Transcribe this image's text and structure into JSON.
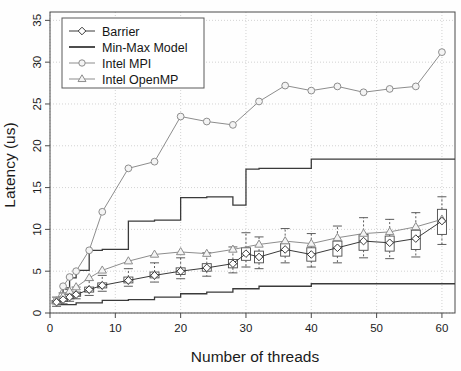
{
  "chart_data": {
    "type": "line",
    "title": "",
    "xlabel": "Number of threads",
    "ylabel": "Latency (us)",
    "xlim": [
      0,
      62
    ],
    "ylim": [
      0,
      36
    ],
    "xticks": [
      0,
      10,
      20,
      30,
      40,
      50,
      60
    ],
    "yticks": [
      0,
      5,
      10,
      15,
      20,
      25,
      30,
      35
    ],
    "grid": true,
    "grid_style": "dotted",
    "legend_position": "top-left",
    "legend": [
      "Barrier",
      "Min-Max Model",
      "Intel MPI",
      "Intel OpenMP"
    ],
    "series": [
      {
        "name": "Barrier",
        "marker": "diamond",
        "color": "#3a3a3a",
        "render": "boxplot+line",
        "x": [
          1,
          2,
          3,
          4,
          6,
          8,
          12,
          16,
          20,
          24,
          28,
          30,
          32,
          36,
          40,
          44,
          48,
          52,
          56,
          60
        ],
        "values": [
          1.3,
          1.6,
          1.9,
          2.2,
          2.8,
          3.3,
          3.9,
          4.5,
          5.0,
          5.4,
          5.9,
          7.1,
          6.7,
          7.6,
          7.0,
          7.8,
          8.6,
          8.4,
          8.9,
          11.0
        ],
        "box_q1": [
          1.1,
          1.4,
          1.7,
          2.0,
          2.5,
          3.0,
          3.6,
          4.2,
          4.6,
          5.0,
          5.4,
          6.3,
          6.0,
          6.8,
          6.2,
          6.8,
          7.5,
          7.4,
          7.6,
          9.4
        ],
        "box_q3": [
          1.5,
          1.9,
          2.2,
          2.5,
          3.1,
          3.6,
          4.3,
          4.9,
          5.4,
          5.9,
          6.4,
          7.8,
          7.4,
          8.3,
          7.8,
          8.6,
          9.4,
          9.2,
          9.9,
          12.4
        ],
        "whisker_low": [
          0.8,
          1.1,
          1.4,
          1.7,
          2.1,
          2.6,
          3.2,
          3.7,
          4.1,
          4.4,
          4.8,
          5.5,
          5.3,
          6.0,
          5.5,
          6.0,
          6.6,
          6.5,
          6.7,
          8.2
        ],
        "whisker_high": [
          1.9,
          2.4,
          2.8,
          3.1,
          3.9,
          4.5,
          5.3,
          6.0,
          6.6,
          7.2,
          7.9,
          9.6,
          9.1,
          10.1,
          9.5,
          10.4,
          11.4,
          11.2,
          12.0,
          13.9
        ]
      },
      {
        "name": "Intel MPI",
        "marker": "circle",
        "color": "#8d8d8d",
        "render": "line",
        "x": [
          1,
          2,
          3,
          4,
          6,
          8,
          12,
          16,
          20,
          24,
          28,
          32,
          36,
          40,
          44,
          48,
          52,
          56,
          60
        ],
        "values": [
          1.5,
          3.2,
          4.3,
          5.0,
          7.5,
          12.1,
          17.3,
          18.1,
          23.5,
          22.9,
          22.5,
          25.3,
          27.2,
          26.6,
          27.1,
          26.4,
          26.8,
          27.1,
          31.2
        ]
      },
      {
        "name": "Intel OpenMP",
        "marker": "triangle",
        "color": "#8d8d8d",
        "render": "line",
        "x": [
          1,
          2,
          3,
          4,
          6,
          8,
          12,
          16,
          20,
          24,
          28,
          32,
          36,
          40,
          44,
          48,
          52,
          56,
          60
        ],
        "values": [
          1.4,
          2.0,
          2.6,
          3.1,
          4.2,
          5.1,
          6.2,
          7.0,
          7.3,
          7.1,
          7.6,
          8.2,
          8.6,
          8.3,
          9.0,
          9.5,
          9.7,
          10.3,
          11.2
        ]
      },
      {
        "name": "Min-Max Model (upper)",
        "marker": "none",
        "color": "#3a3a3a",
        "render": "step",
        "x": [
          1,
          2,
          3,
          4,
          6,
          8,
          12,
          16,
          20,
          24,
          28,
          30,
          32,
          40,
          62
        ],
        "values": [
          1.4,
          3.0,
          4.2,
          5.1,
          7.5,
          7.6,
          11.0,
          11.1,
          13.8,
          13.9,
          12.9,
          17.2,
          17.3,
          18.4,
          18.4
        ]
      },
      {
        "name": "Min-Max Model (lower)",
        "marker": "none",
        "color": "#3a3a3a",
        "render": "step",
        "x": [
          1,
          4,
          8,
          12,
          16,
          20,
          24,
          28,
          32,
          40,
          62
        ],
        "values": [
          1.0,
          1.2,
          1.5,
          1.6,
          1.9,
          2.3,
          2.5,
          2.9,
          3.2,
          3.5,
          3.5
        ]
      }
    ]
  },
  "axes": {
    "ylabel": "Latency (us)",
    "xlabel": "Number of threads",
    "xtick_labels": [
      "0",
      "10",
      "20",
      "30",
      "40",
      "50",
      "60"
    ],
    "ytick_labels": [
      "0",
      "5",
      "10",
      "15",
      "20",
      "25",
      "30",
      "35"
    ]
  },
  "legend": {
    "entries": [
      {
        "label": "Barrier",
        "marker": "diamond",
        "color": "#3a3a3a"
      },
      {
        "label": "Min-Max Model",
        "marker": "none",
        "color": "#3a3a3a"
      },
      {
        "label": "Intel MPI",
        "marker": "circle",
        "color": "#8d8d8d"
      },
      {
        "label": "Intel OpenMP",
        "marker": "triangle",
        "color": "#8d8d8d"
      }
    ]
  },
  "colors": {
    "dark": "#3a3a3a",
    "grey": "#8d8d8d",
    "axis": "#4a4a4a",
    "grid": "#c8c8c8",
    "background": "#fefefe"
  }
}
